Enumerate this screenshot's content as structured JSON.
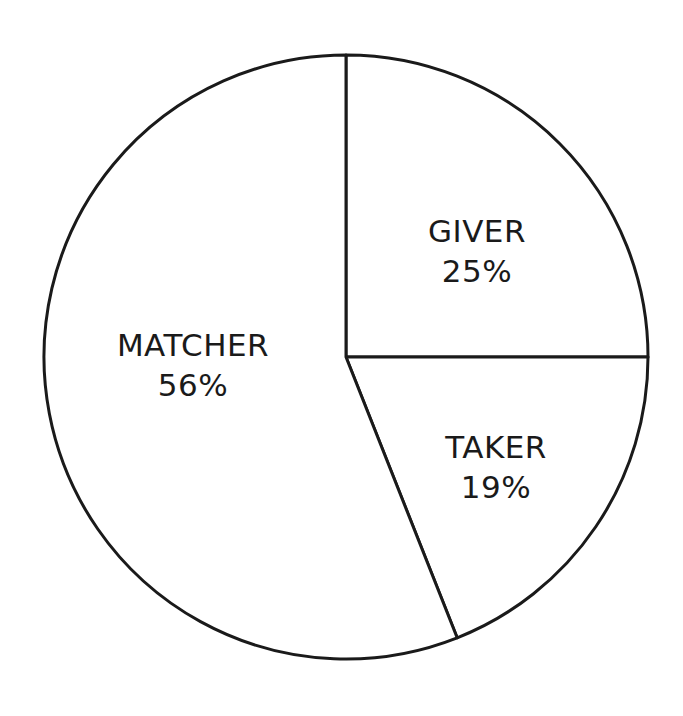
{
  "chart_data": {
    "type": "pie",
    "title": "",
    "categories": [
      "GIVER",
      "TAKER",
      "MATCHER"
    ],
    "values": [
      25,
      19,
      56
    ],
    "labels": [
      "GIVER 25%",
      "TAKER 19%",
      "MATCHER 56%"
    ],
    "start_angle_deg": 90,
    "direction": "clockwise",
    "legend": "none",
    "colors": [
      "#ffffff",
      "#ffffff",
      "#ffffff"
    ],
    "stroke": "#1a1a1a"
  },
  "slices": [
    {
      "name": "GIVER",
      "pct": "25%"
    },
    {
      "name": "TAKER",
      "pct": "19%"
    },
    {
      "name": "MATCHER",
      "pct": "56%"
    }
  ]
}
